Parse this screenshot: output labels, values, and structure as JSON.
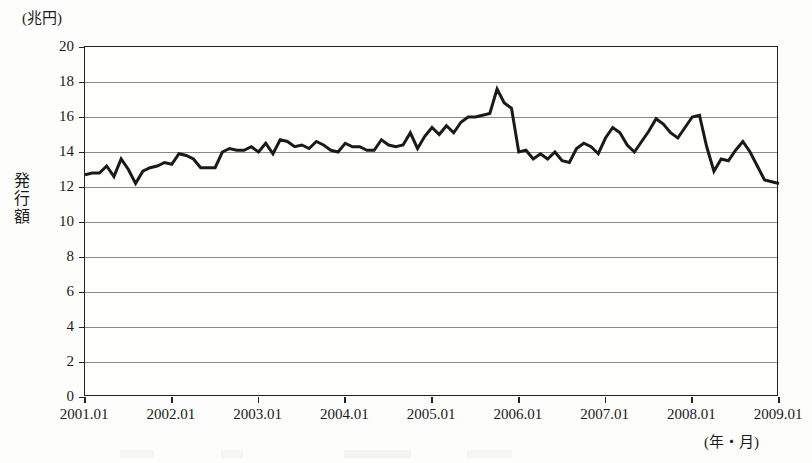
{
  "chart_data": {
    "type": "line",
    "title": "",
    "subtitle": "",
    "xlabel": "(年・月)",
    "ylabel": "発行額",
    "yunit": "(兆円)",
    "ylim": [
      0,
      20
    ],
    "ytick_step": 2,
    "ytick_labels": [
      "20",
      "18",
      "16",
      "14",
      "12",
      "10",
      "8",
      "6",
      "4",
      "2",
      "0"
    ],
    "ytick_values": [
      20,
      18,
      16,
      14,
      12,
      10,
      8,
      6,
      4,
      2,
      0
    ],
    "xtick_labels": [
      "2001.01",
      "2002.01",
      "2003.01",
      "2004.01",
      "2005.01",
      "2006.01",
      "2007.01",
      "2008.01",
      "2009.01"
    ],
    "xtick_values": [
      2001.0,
      2002.0,
      2003.0,
      2004.0,
      2005.0,
      2006.0,
      2007.0,
      2008.0,
      2009.0
    ],
    "xlim": [
      2001.0,
      2009.0
    ],
    "grid": true,
    "grid_axis": "y",
    "legend": "none",
    "line_color": "#1a1a1a",
    "line_width": 3,
    "series": [
      {
        "name": "発行額",
        "x": [
          "2001.01",
          "2001.02",
          "2001.03",
          "2001.04",
          "2001.05",
          "2001.06",
          "2001.07",
          "2001.08",
          "2001.09",
          "2001.10",
          "2001.11",
          "2001.12",
          "2002.01",
          "2002.02",
          "2002.03",
          "2002.04",
          "2002.05",
          "2002.06",
          "2002.07",
          "2002.08",
          "2002.09",
          "2002.10",
          "2002.11",
          "2002.12",
          "2003.01",
          "2003.02",
          "2003.03",
          "2003.04",
          "2003.05",
          "2003.06",
          "2003.07",
          "2003.08",
          "2003.09",
          "2003.10",
          "2003.11",
          "2003.12",
          "2004.01",
          "2004.02",
          "2004.03",
          "2004.04",
          "2004.05",
          "2004.06",
          "2004.07",
          "2004.08",
          "2004.09",
          "2004.10",
          "2004.11",
          "2004.12",
          "2005.01",
          "2005.02",
          "2005.03",
          "2005.04",
          "2005.05",
          "2005.06",
          "2005.07",
          "2005.08",
          "2005.09",
          "2005.10",
          "2005.11",
          "2005.12",
          "2006.01",
          "2006.02",
          "2006.03",
          "2006.04",
          "2006.05",
          "2006.06",
          "2006.07",
          "2006.08",
          "2006.09",
          "2006.10",
          "2006.11",
          "2006.12",
          "2007.01",
          "2007.02",
          "2007.03",
          "2007.04",
          "2007.05",
          "2007.06",
          "2007.07",
          "2007.08",
          "2007.09",
          "2007.10",
          "2007.11",
          "2007.12",
          "2008.01",
          "2008.02",
          "2008.03",
          "2008.04",
          "2008.05",
          "2008.06",
          "2008.07",
          "2008.08",
          "2008.09",
          "2008.10",
          "2008.11",
          "2008.12",
          "2009.01"
        ],
        "values": [
          12.7,
          12.8,
          12.8,
          13.2,
          12.6,
          13.6,
          13.0,
          12.2,
          12.9,
          13.1,
          13.2,
          13.4,
          13.3,
          13.9,
          13.8,
          13.6,
          13.1,
          13.1,
          13.1,
          14.0,
          14.2,
          14.1,
          14.1,
          14.3,
          14.0,
          14.5,
          13.9,
          14.7,
          14.6,
          14.3,
          14.4,
          14.2,
          14.6,
          14.4,
          14.1,
          14.0,
          14.5,
          14.3,
          14.3,
          14.1,
          14.1,
          14.7,
          14.4,
          14.3,
          14.4,
          15.1,
          14.2,
          14.9,
          15.4,
          15.0,
          15.5,
          15.1,
          15.7,
          16.0,
          16.0,
          16.1,
          16.2,
          17.6,
          16.8,
          16.5,
          14.0,
          14.1,
          13.6,
          13.9,
          13.6,
          14.0,
          13.5,
          13.4,
          14.2,
          14.5,
          14.3,
          13.9,
          14.8,
          15.4,
          15.1,
          14.4,
          14.0,
          14.6,
          15.2,
          15.9,
          15.6,
          15.1,
          14.8,
          15.4,
          16.0,
          16.1,
          14.3,
          12.9,
          13.6,
          13.5,
          14.1,
          14.6,
          14.0,
          13.2,
          12.4,
          12.3,
          12.2
        ]
      }
    ]
  },
  "axes": {
    "unit_label": "(兆円)",
    "y_title_chars": [
      "発",
      "行",
      "額"
    ],
    "x_unit_label": "(年・月)"
  }
}
